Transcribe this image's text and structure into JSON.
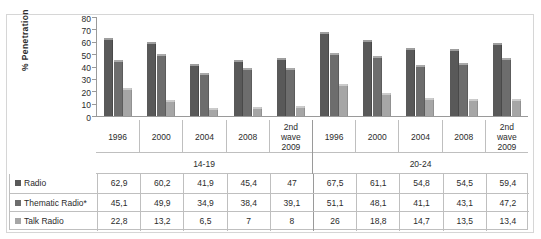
{
  "chart_data": {
    "type": "bar",
    "title": "",
    "xlabel": "",
    "ylabel": "% Penetration",
    "ylim": [
      0,
      80
    ],
    "yticks": [
      80,
      70,
      60,
      50,
      40,
      30,
      20,
      10,
      0
    ],
    "grid": false,
    "legend_position": "row-labels-in-table",
    "group_labels": [
      "14-19",
      "20-24"
    ],
    "categories": [
      "1996",
      "2000",
      "2004",
      "2008",
      "2nd wave 2009",
      "1996",
      "2000",
      "2004",
      "2008",
      "2nd wave 2009"
    ],
    "series": [
      {
        "name": "Radio",
        "color": "#595959",
        "values": [
          62.9,
          60.2,
          41.9,
          45.4,
          47,
          67.5,
          61.1,
          54.8,
          54.5,
          59.4
        ]
      },
      {
        "name": "Thematic Radio*",
        "color": "#6d6d6d",
        "values": [
          45.1,
          49.9,
          34.9,
          38.4,
          39.1,
          51.1,
          48.1,
          41.1,
          43.1,
          47.2
        ]
      },
      {
        "name": "Talk Radio",
        "color": "#a6a6a6",
        "values": [
          22.8,
          13.2,
          6.5,
          7,
          8,
          26,
          18.8,
          14.7,
          13.5,
          13.4
        ]
      }
    ]
  },
  "table": {
    "rows": [
      {
        "label": "Radio",
        "values": [
          "62,9",
          "60,2",
          "41,9",
          "45,4",
          "47",
          "67,5",
          "61,1",
          "54,8",
          "54,5",
          "59,4"
        ]
      },
      {
        "label": "Thematic Radio*",
        "values": [
          "45,1",
          "49,9",
          "34,9",
          "38,4",
          "39,1",
          "51,1",
          "48,1",
          "41,1",
          "43,1",
          "47,2"
        ]
      },
      {
        "label": "Talk Radio",
        "values": [
          "22,8",
          "13,2",
          "6,5",
          "7",
          "8",
          "26",
          "18,8",
          "14,7",
          "13,5",
          "13,4"
        ]
      }
    ]
  },
  "category_display": [
    [
      "1996"
    ],
    [
      "2000"
    ],
    [
      "2004"
    ],
    [
      "2008"
    ],
    [
      "2nd",
      "wave",
      "2009"
    ],
    [
      "1996"
    ],
    [
      "2000"
    ],
    [
      "2004"
    ],
    [
      "2008"
    ],
    [
      "2nd",
      "wave",
      "2009"
    ]
  ]
}
